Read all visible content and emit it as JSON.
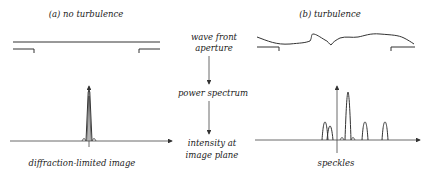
{
  "panel_a": {
    "title": "(a) no turbulence",
    "caption": "diffraction-limited image"
  },
  "panel_b": {
    "title": "(b) turbulence",
    "caption": "speckles"
  },
  "center": {
    "step1_line1": "wave front",
    "step1_line2": "aperture",
    "step2": "power spectrum",
    "step3_line1": "intensity at",
    "step3_line2": "image plane"
  }
}
